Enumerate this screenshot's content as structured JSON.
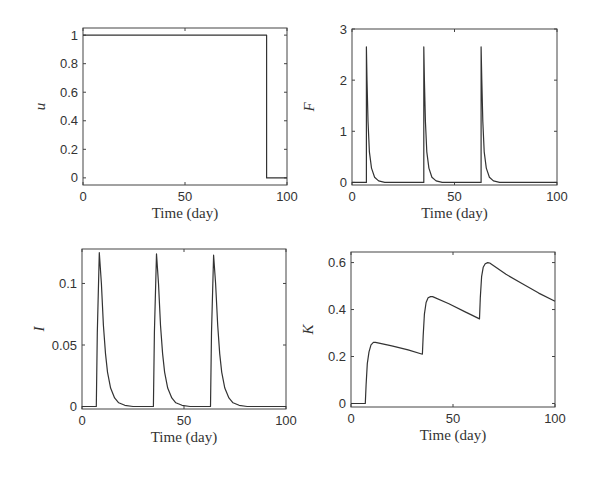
{
  "figure": {
    "width": 589,
    "height": 477
  },
  "chart_data": [
    {
      "id": "u",
      "type": "line",
      "title": "",
      "xlabel": "Time (day)",
      "ylabel": "u",
      "box": {
        "x0": 83,
        "y0": 28,
        "x1": 287,
        "y1": 185
      },
      "xlim": [
        0,
        100
      ],
      "ylim": [
        -0.05,
        1.05
      ],
      "xticks": [
        0,
        50,
        100
      ],
      "xtick_labels": [
        "0",
        "50",
        "100"
      ],
      "yticks": [
        0,
        0.2,
        0.4,
        0.6,
        0.8,
        1
      ],
      "ytick_labels": [
        "0",
        "0.2",
        "0.4",
        "0.6",
        "0.8",
        "1"
      ],
      "grid": false,
      "series": [
        {
          "name": "u",
          "x": [
            0,
            90,
            90,
            100
          ],
          "y": [
            1,
            1,
            0,
            0
          ]
        }
      ]
    },
    {
      "id": "F",
      "type": "line",
      "title": "",
      "xlabel": "Time (day)",
      "ylabel": "F",
      "box": {
        "x0": 352,
        "y0": 29,
        "x1": 557,
        "y1": 185
      },
      "xlim": [
        0,
        100
      ],
      "ylim": [
        -0.05,
        3
      ],
      "xticks": [
        0,
        50,
        100
      ],
      "xtick_labels": [
        "0",
        "50",
        "100"
      ],
      "yticks": [
        0,
        1,
        2,
        3
      ],
      "ytick_labels": [
        "0",
        "1",
        "2",
        "3"
      ],
      "grid": false,
      "series": [
        {
          "name": "F",
          "x": [
            0,
            7,
            7,
            7.3,
            7.8,
            8.5,
            9.5,
            11,
            13,
            16,
            35,
            35,
            35.3,
            35.8,
            36.5,
            37.5,
            39,
            41,
            44,
            63,
            63,
            63.3,
            63.8,
            64.5,
            65.5,
            67,
            69,
            72,
            100
          ],
          "y": [
            0,
            0,
            2.65,
            2.0,
            1.2,
            0.6,
            0.28,
            0.1,
            0.03,
            0.0,
            0,
            2.65,
            2.0,
            1.2,
            0.6,
            0.28,
            0.1,
            0.03,
            0.0,
            0,
            2.65,
            2.0,
            1.2,
            0.6,
            0.28,
            0.1,
            0.03,
            0.0,
            0
          ]
        }
      ]
    },
    {
      "id": "I",
      "type": "line",
      "title": "",
      "xlabel": "Time (day)",
      "ylabel": "I",
      "box": {
        "x0": 82,
        "y0": 249,
        "x1": 286,
        "y1": 409
      },
      "xlim": [
        0,
        100
      ],
      "ylim": [
        -0.002,
        0.128
      ],
      "xticks": [
        0,
        50,
        100
      ],
      "xtick_labels": [
        "0",
        "50",
        "100"
      ],
      "yticks": [
        0,
        0.05,
        0.1
      ],
      "ytick_labels": [
        "0",
        "0.05",
        "0.1"
      ],
      "grid": false,
      "series": [
        {
          "name": "I",
          "x": [
            0,
            7,
            7.5,
            8.5,
            9.5,
            10.5,
            11.5,
            12.5,
            14,
            16,
            18,
            21,
            25,
            35,
            35.5,
            36.5,
            37.5,
            38.5,
            39.5,
            40.5,
            42,
            44,
            46,
            49,
            53,
            63,
            63.5,
            64.5,
            65.5,
            66.5,
            67.5,
            68.5,
            70,
            72,
            74,
            77,
            81,
            100
          ],
          "y": [
            0,
            0,
            0.06,
            0.125,
            0.1,
            0.066,
            0.043,
            0.028,
            0.015,
            0.007,
            0.003,
            0.001,
            0,
            0,
            0.06,
            0.124,
            0.1,
            0.066,
            0.043,
            0.028,
            0.015,
            0.007,
            0.003,
            0.001,
            0,
            0,
            0.06,
            0.123,
            0.1,
            0.066,
            0.043,
            0.028,
            0.015,
            0.007,
            0.003,
            0.001,
            0,
            0
          ]
        }
      ]
    },
    {
      "id": "K",
      "type": "line",
      "title": "",
      "xlabel": "Time (day)",
      "ylabel": "K",
      "box": {
        "x0": 351,
        "y0": 252,
        "x1": 555,
        "y1": 407
      },
      "xlim": [
        0,
        100
      ],
      "ylim": [
        -0.015,
        0.645
      ],
      "xticks": [
        0,
        50,
        100
      ],
      "xtick_labels": [
        "0",
        "50",
        "100"
      ],
      "yticks": [
        0,
        0.2,
        0.4,
        0.6
      ],
      "ytick_labels": [
        "0",
        "0.2",
        "0.4",
        "0.6"
      ],
      "grid": false,
      "series": [
        {
          "name": "K",
          "x": [
            0,
            7,
            7.4,
            8,
            8.8,
            9.8,
            11,
            12,
            20,
            28,
            35,
            35.4,
            36,
            36.8,
            37.8,
            39,
            40,
            48,
            56,
            63,
            63.4,
            64,
            64.8,
            65.8,
            67,
            68,
            76,
            84,
            92,
            100
          ],
          "y": [
            0,
            0,
            0.08,
            0.17,
            0.22,
            0.25,
            0.26,
            0.26,
            0.245,
            0.228,
            0.21,
            0.29,
            0.38,
            0.43,
            0.45,
            0.455,
            0.455,
            0.425,
            0.39,
            0.36,
            0.45,
            0.54,
            0.58,
            0.595,
            0.6,
            0.598,
            0.55,
            0.51,
            0.47,
            0.435
          ]
        }
      ]
    }
  ]
}
